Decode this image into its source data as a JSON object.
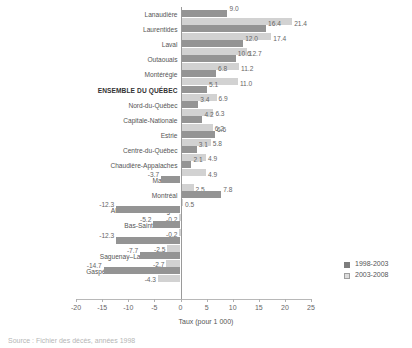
{
  "chart_data": {
    "type": "bar",
    "orientation": "horizontal",
    "title": "",
    "xlabel": "Taux (pour 1 000)",
    "ylabel": "",
    "xlim": [
      -20,
      25
    ],
    "xticks": [
      -20,
      -15,
      -10,
      -5,
      0,
      5,
      10,
      15,
      20,
      25
    ],
    "xtick_labels": [
      "-20",
      "-15",
      "-10",
      "-5",
      "0",
      "5",
      "10",
      "15",
      "20",
      "25"
    ],
    "grid": false,
    "legend_position": "right-bottom",
    "categories": [
      "Lanaudière",
      "Laurentides",
      "Laval",
      "Outaouais",
      "Montérégie",
      "ENSEMBLE DU QUÉBEC",
      "Nord-du-Québec",
      "Capitale-Nationale",
      "Estrie",
      "Centre-du-Québec",
      "Chaudière-Appalaches",
      "Mauricie",
      "Montréal",
      "Abitibi-Témiscamingue",
      "Bas-Saint-Laurent",
      "Côte-Nord",
      "Saguenay–Lac-Saint-Jean",
      "Gaspésie–Îles-de-la-Madeleine"
    ],
    "highlight_category": "ENSEMBLE DU QUÉBEC",
    "series": [
      {
        "name": "1998-2003",
        "color": "#949494",
        "values": [
          9.0,
          16.4,
          12.0,
          10.6,
          6.8,
          5.1,
          3.4,
          4.2,
          6.6,
          3.1,
          2.1,
          -3.7,
          7.8,
          -12.3,
          -5.2,
          -12.3,
          -7.7,
          -14.7
        ],
        "labels": [
          "9.0",
          "16.4",
          "12.0",
          "10.6",
          "6.8",
          "5.1",
          "3.4",
          "4.2",
          "6.6",
          "3.1",
          "2.1",
          "-3.7",
          "7.8",
          "-12.3",
          "-5.2",
          "-12.3",
          "-7.7",
          "-14.7"
        ]
      },
      {
        "name": "2003-2008",
        "color": "#d2d2d2",
        "values": [
          21.4,
          17.4,
          12.7,
          11.2,
          11.0,
          6.9,
          6.3,
          6.2,
          5.8,
          4.9,
          4.9,
          2.5,
          0.5,
          -0.2,
          -0.2,
          -2.5,
          -2.7,
          -4.3
        ],
        "labels": [
          "21.4",
          "17.4",
          "12.7",
          "11.2",
          "11.0",
          "6.9",
          "6.3",
          "6.2",
          "5.8",
          "4.9",
          "4.9",
          "2.5",
          "0.5",
          "-0.2",
          "-0.2",
          "-2.5",
          "-2.7",
          "-4.3"
        ]
      }
    ]
  },
  "legend": {
    "items": [
      {
        "label": "1998-2003"
      },
      {
        "label": "2003-2008"
      }
    ]
  },
  "axis": {
    "title": "Taux (pour 1 000)"
  },
  "footer": {
    "source": "Source : Fichier des décès, années 1998"
  }
}
